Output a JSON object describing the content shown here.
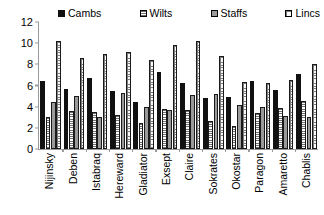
{
  "chart_data": {
    "type": "bar",
    "title": "",
    "xlabel": "",
    "ylabel": "",
    "ylim": [
      0,
      12
    ],
    "yticks": [
      12,
      10,
      8,
      6,
      4,
      2,
      0
    ],
    "grid": false,
    "legend_position": "top",
    "categories": [
      "Nijinsky",
      "Deben",
      "Istabraq",
      "Hereward",
      "Gladiator",
      "Exsept",
      "Claire",
      "Sokrates",
      "Okostar",
      "Paragon",
      "Amaretto",
      "Chablis"
    ],
    "series": [
      {
        "name": "Cambs",
        "pattern": "solid-black",
        "color": "#111111",
        "values": [
          6.4,
          5.7,
          6.7,
          5.5,
          4.4,
          7.3,
          6.2,
          4.8,
          4.9,
          6.4,
          5.6,
          7.05
        ]
      },
      {
        "name": "Wilts",
        "pattern": "horizontal-lines",
        "color": "#6f6f6f",
        "values": [
          3.0,
          3.6,
          3.5,
          3.2,
          2.5,
          3.8,
          3.7,
          2.6,
          2.2,
          3.4,
          3.9,
          4.5
        ]
      },
      {
        "name": "Staffs",
        "pattern": "solid-gray",
        "color": "#9a9a9a",
        "values": [
          4.4,
          5.0,
          3.0,
          5.3,
          4.0,
          3.7,
          5.1,
          5.2,
          4.2,
          4.0,
          3.1,
          3.0
        ]
      },
      {
        "name": "Lincs",
        "pattern": "dotted-grid",
        "color": "#7d7d7d",
        "values": [
          10.2,
          8.6,
          9.0,
          9.2,
          8.4,
          9.8,
          10.2,
          8.8,
          6.3,
          6.2,
          6.5,
          8.0
        ]
      }
    ]
  },
  "legend": {
    "items": [
      {
        "label": "Cambs"
      },
      {
        "label": "Wilts"
      },
      {
        "label": "Staffs"
      },
      {
        "label": "Lincs"
      }
    ]
  },
  "axis": {
    "y_tick_labels": [
      "12",
      "10",
      "8",
      "6",
      "4",
      "2",
      "0"
    ]
  }
}
